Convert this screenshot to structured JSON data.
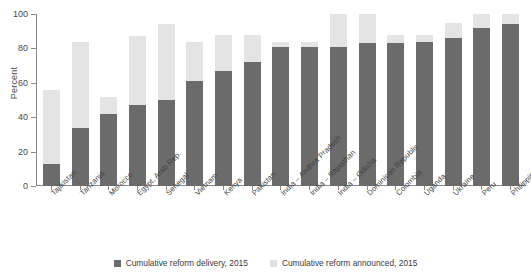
{
  "chart_data": {
    "type": "bar",
    "title": "",
    "xlabel": "",
    "ylabel": "Percent",
    "ylim": [
      0,
      100
    ],
    "yticks": [
      0,
      20,
      40,
      60,
      80,
      100
    ],
    "grid": false,
    "legend_position": "bottom",
    "stacked_overlay": true,
    "categories": [
      "Tajikistan",
      "Tanzania",
      "Morocco",
      "Egypt, Arab Rep.",
      "Senegal",
      "Vietnam",
      "Kenya",
      "Pakistan",
      "India – Andhra Pradesh",
      "India – Rajasthan",
      "India – Odisha",
      "Dominican Republic",
      "Colombia",
      "Uganda",
      "Ukraine",
      "Peru",
      "Philippines"
    ],
    "series": [
      {
        "name": "Cumulative reform delivery, 2015",
        "color": "#6b6b6b",
        "values": [
          13,
          34,
          42,
          47,
          50,
          61,
          67,
          72,
          81,
          81,
          81,
          83,
          83,
          84,
          86,
          92,
          94
        ]
      },
      {
        "name": "Cumulative reform announced, 2015",
        "color": "#e4e4e4",
        "values": [
          56,
          84,
          52,
          87,
          94,
          84,
          88,
          88,
          84,
          84,
          100,
          100,
          88,
          88,
          95,
          100,
          100
        ]
      }
    ]
  },
  "legend": {
    "items": [
      {
        "label": "Cumulative reform delivery, 2015",
        "swatch": "dark-swatch-icon"
      },
      {
        "label": "Cumulative reform announced, 2015",
        "swatch": "light-swatch-icon"
      }
    ]
  }
}
